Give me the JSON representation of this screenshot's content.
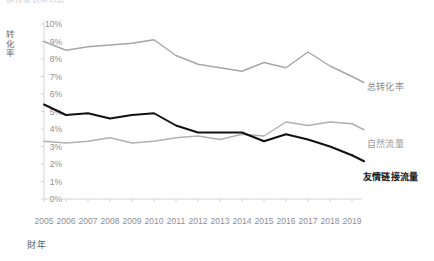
{
  "clipped_title": "转化率趋势分析",
  "axis": {
    "y_title": "转化率",
    "x_title": "財年",
    "y_ticks": [
      "10%",
      "9%",
      "8%",
      "7%",
      "6%",
      "5%",
      "4%",
      "3%",
      "2%",
      "1%",
      "0%"
    ],
    "x_ticks": [
      "2005",
      "2006",
      "2007",
      "2008",
      "2009",
      "2010",
      "2011",
      "2012",
      "2013",
      "2014",
      "2015",
      "2016",
      "2017",
      "2018",
      "2019"
    ]
  },
  "legend": {
    "total": "总转化率",
    "organic": "自然流量",
    "referral": "友情链接流量"
  },
  "colors": {
    "total": "#a6a6a6",
    "organic": "#b0b0b0",
    "referral": "#111111",
    "axis": "#d4d4d4",
    "tick_text": "#8e8e96"
  },
  "chart_data": {
    "type": "line",
    "title": "转化率趋势分析",
    "xlabel": "財年",
    "ylabel": "转化率",
    "ylim": [
      0,
      10
    ],
    "grid": false,
    "legend_position": "right-inline",
    "x": [
      "2005",
      "2006",
      "2007",
      "2008",
      "2009",
      "2010",
      "2011",
      "2012",
      "2013",
      "2014",
      "2015",
      "2016",
      "2017",
      "2018",
      "2019"
    ],
    "series": [
      {
        "name": "总转化率",
        "color": "#a6a6a6",
        "values": [
          9.0,
          8.5,
          8.7,
          8.8,
          8.9,
          9.1,
          8.2,
          7.7,
          7.5,
          7.3,
          7.8,
          7.5,
          8.4,
          7.6,
          7.0
        ]
      },
      {
        "name": "自然流量",
        "color": "#b0b0b0",
        "values": [
          3.3,
          3.2,
          3.3,
          3.5,
          3.2,
          3.3,
          3.5,
          3.6,
          3.4,
          3.7,
          3.6,
          4.4,
          4.2,
          4.4,
          4.3
        ]
      },
      {
        "name": "友情链接流量",
        "color": "#111111",
        "values": [
          5.4,
          4.8,
          4.9,
          4.6,
          4.8,
          4.9,
          4.2,
          3.8,
          3.8,
          3.8,
          3.3,
          3.7,
          3.4,
          3.0,
          2.5
        ]
      }
    ]
  }
}
